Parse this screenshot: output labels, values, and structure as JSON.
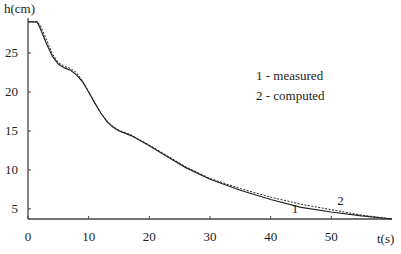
{
  "chart_data": {
    "type": "line",
    "title": "",
    "xlabel": "t(s)",
    "ylabel": "h(cm)",
    "xlim": [
      0,
      60
    ],
    "ylim": [
      3.7,
      29.5
    ],
    "x_ticks": [
      0,
      10,
      20,
      30,
      40,
      50
    ],
    "y_ticks": [
      5,
      10,
      15,
      20,
      25
    ],
    "grid": false,
    "legend": {
      "placement": "top-right",
      "entries": [
        "1 - measured",
        "2 - computed"
      ]
    },
    "series": [
      {
        "name": "1 - measured",
        "label": "1",
        "style": "solid",
        "x": [
          0,
          1.5,
          2,
          3,
          4,
          5,
          6,
          7,
          8,
          9,
          10,
          11,
          12,
          13,
          14,
          15,
          17,
          20,
          23,
          26,
          30,
          35,
          40,
          45,
          50,
          55,
          60
        ],
        "y": [
          29,
          29,
          28.2,
          26.3,
          24.6,
          23.6,
          23.1,
          22.8,
          22.2,
          21.3,
          20.0,
          18.6,
          17.3,
          16.2,
          15.5,
          15.0,
          14.4,
          13.1,
          11.7,
          10.3,
          8.8,
          7.4,
          6.2,
          5.2,
          4.6,
          4.1,
          3.7
        ]
      },
      {
        "name": "2 - computed",
        "label": "2",
        "style": "dashed",
        "x": [
          0,
          1.5,
          2,
          3,
          4,
          5,
          6,
          7,
          8,
          9,
          10,
          11,
          12,
          13,
          14,
          15,
          17,
          20,
          23,
          26,
          30,
          35,
          40,
          45,
          50,
          55,
          60
        ],
        "y": [
          29,
          29,
          28.6,
          26.8,
          24.9,
          23.8,
          23.3,
          23.0,
          22.5,
          21.4,
          20.0,
          18.6,
          17.3,
          16.3,
          15.6,
          15.1,
          14.5,
          13.2,
          11.8,
          10.4,
          8.9,
          7.6,
          6.5,
          5.6,
          4.9,
          4.2,
          3.7
        ]
      }
    ],
    "annotations": [
      {
        "text": "1",
        "x": 44,
        "y": 4.5
      },
      {
        "text": "2",
        "x": 51.5,
        "y": 5.5
      }
    ]
  }
}
